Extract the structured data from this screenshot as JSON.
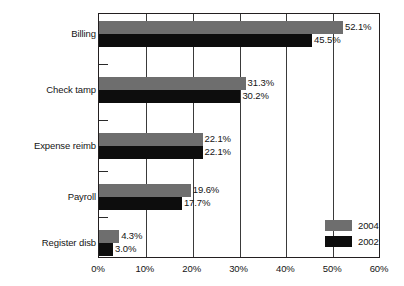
{
  "chart_data": {
    "type": "bar",
    "orientation": "horizontal",
    "title": "",
    "subtitle": "",
    "xlabel": "",
    "ylabel": "",
    "categories": [
      "Billing",
      "Check tamp",
      "Expense reimb",
      "Payroll",
      "Register disb"
    ],
    "series": [
      {
        "name": "2004",
        "color": "#6e6e6e",
        "values": [
          52.1,
          31.3,
          22.1,
          19.6,
          4.3
        ],
        "value_labels": [
          "52.1%",
          "31.3%",
          "22.1%",
          "19.6%",
          "4.3%"
        ]
      },
      {
        "name": "2002",
        "color": "#0d0d0d",
        "values": [
          45.5,
          30.2,
          22.1,
          17.7,
          3.0
        ],
        "value_labels": [
          "45.5%",
          "30.2%",
          "22.1%",
          "17.7%",
          "3.0%"
        ]
      }
    ],
    "xlim": [
      0,
      60
    ],
    "xticks": [
      0,
      10,
      20,
      30,
      40,
      50,
      60
    ],
    "xtick_labels": [
      "0%",
      "10%",
      "20%",
      "30%",
      "40%",
      "50%",
      "60%"
    ],
    "grid": "vertical",
    "legend_position": "bottom-right",
    "legend": [
      {
        "label": "2004",
        "color": "#6e6e6e"
      },
      {
        "label": "2002",
        "color": "#0d0d0d"
      }
    ],
    "frame_color": "#231f20",
    "background": "#ffffff"
  }
}
